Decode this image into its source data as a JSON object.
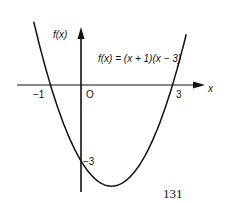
{
  "figure": {
    "y_axis_label": "f(x)",
    "x_axis_label": "x",
    "equation": "f(x) = (x + 1)(x − 3)",
    "origin_label": "O",
    "root_left_label": "−1",
    "root_right_label": "3",
    "y_intercept_label": "−3",
    "colors": {
      "ink": "#111111",
      "background": "#ffffff"
    }
  },
  "page_number": "131",
  "chart_data": {
    "type": "line",
    "title": "f(x) = (x + 1)(x − 3)",
    "xlabel": "x",
    "ylabel": "f(x)",
    "function": "(x + 1)(x - 3)",
    "roots": [
      -1,
      3
    ],
    "y_intercept": -3,
    "vertex": [
      1,
      -4
    ],
    "annotations": [
      "−1",
      "O",
      "3",
      "−3"
    ],
    "grid": false
  }
}
